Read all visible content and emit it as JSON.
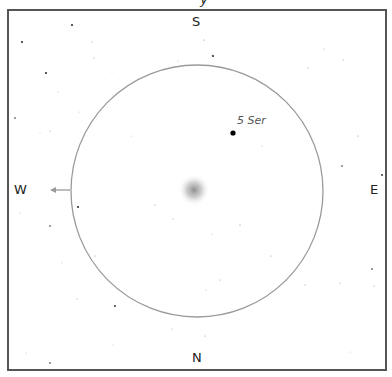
{
  "finder_chart": {
    "title_fragment": "y",
    "compass": {
      "top": "S",
      "bottom": "N",
      "left": "W",
      "right": "E"
    },
    "field_circle": {
      "cx": 197,
      "cy": 191,
      "r": 126,
      "stroke": "#9a9a9a"
    },
    "target_object": {
      "type": "diffuse-glow",
      "cx": 194,
      "cy": 190,
      "r": 16
    },
    "labeled_star": {
      "name": "5 Ser",
      "x": 233,
      "y": 133
    },
    "direction_arrow": {
      "from_x": 70,
      "to_x": 50,
      "y": 190,
      "color": "#9a9a9a"
    },
    "colors": {
      "frame": "#555555",
      "background": "#ffffff",
      "label": "#222222"
    }
  },
  "stars": [
    [
      72,
      25,
      1.0
    ],
    [
      22,
      42,
      1.0
    ],
    [
      204,
      40,
      0.6
    ],
    [
      213,
      56,
      1.0
    ],
    [
      46,
      73,
      1.0
    ],
    [
      92,
      42,
      0.5
    ],
    [
      94,
      58,
      0.5
    ],
    [
      324,
      49,
      0.5
    ],
    [
      343,
      60,
      0.5
    ],
    [
      178,
      61,
      0.4
    ],
    [
      112,
      72,
      0.4
    ],
    [
      15,
      118,
      0.8
    ],
    [
      58,
      92,
      0.4
    ],
    [
      79,
      112,
      0.4
    ],
    [
      50,
      131,
      0.5
    ],
    [
      40,
      133,
      0.4
    ],
    [
      212,
      55,
      0.5
    ],
    [
      308,
      68,
      0.5
    ],
    [
      358,
      136,
      0.6
    ],
    [
      342,
      166,
      0.8
    ],
    [
      382,
      175,
      0.9
    ],
    [
      398,
      128,
      0.4
    ],
    [
      262,
      146,
      0.4
    ],
    [
      131,
      136,
      0.4
    ],
    [
      155,
      205,
      0.5
    ],
    [
      78,
      207,
      1.0
    ],
    [
      50,
      226,
      0.8
    ],
    [
      20,
      213,
      0.4
    ],
    [
      95,
      256,
      0.5
    ],
    [
      77,
      299,
      0.5
    ],
    [
      115,
      306,
      0.9
    ],
    [
      212,
      234,
      0.4
    ],
    [
      240,
      225,
      0.6
    ],
    [
      271,
      256,
      0.5
    ],
    [
      220,
      280,
      0.5
    ],
    [
      305,
      285,
      0.5
    ],
    [
      340,
      283,
      0.5
    ],
    [
      372,
      269,
      0.8
    ],
    [
      374,
      286,
      0.5
    ],
    [
      62,
      263,
      0.4
    ],
    [
      173,
      219,
      0.5
    ],
    [
      206,
      290,
      0.4
    ],
    [
      50,
      363,
      0.8
    ],
    [
      172,
      329,
      0.5
    ],
    [
      205,
      336,
      0.5
    ],
    [
      228,
      371,
      0.5
    ],
    [
      350,
      352,
      0.4
    ],
    [
      26,
      353,
      0.4
    ],
    [
      113,
      345,
      0.4
    ]
  ]
}
